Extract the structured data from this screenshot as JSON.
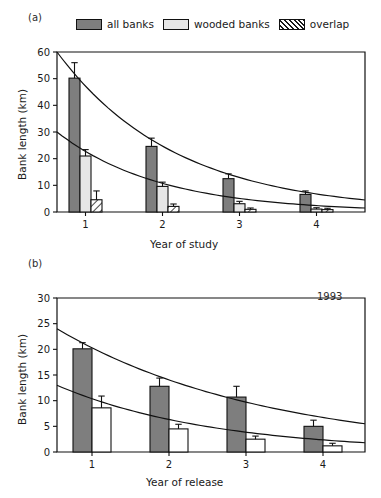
{
  "figure": {
    "panel_a_tag": "(a)",
    "panel_b_tag": "(b)"
  },
  "legend": {
    "items": [
      {
        "label": "all banks",
        "swatch": "dark-gray-fill",
        "color": "#7e7e7e"
      },
      {
        "label": "wooded banks",
        "swatch": "light-gray-fill",
        "color": "#e6e6e6"
      },
      {
        "label": "overlap",
        "swatch": "diagonal-hatch-fill",
        "color": "#ffffff"
      }
    ]
  },
  "chart_data": [
    {
      "type": "bar",
      "panel": "(a)",
      "title": "",
      "xlabel": "Year of study",
      "ylabel": "Bank length (km)",
      "categories": [
        "1",
        "2",
        "3",
        "4"
      ],
      "ylim": [
        0,
        60
      ],
      "yticks": [
        0,
        10,
        20,
        30,
        40,
        50,
        60
      ],
      "grid": false,
      "legend_position": "above-plot",
      "series": [
        {
          "name": "all banks",
          "color": "#7e7e7e",
          "values": [
            50.2,
            24.6,
            12.5,
            6.6
          ],
          "errors": [
            5.8,
            3.1,
            1.8,
            1.3
          ]
        },
        {
          "name": "wooded banks",
          "color": "#e6e6e6",
          "values": [
            21.0,
            9.6,
            3.1,
            1.1
          ],
          "errors": [
            2.4,
            1.6,
            0.9,
            0.5
          ]
        },
        {
          "name": "overlap",
          "color": "#ffffff",
          "values": [
            4.6,
            2.1,
            1.0,
            0.9
          ],
          "errors": [
            3.3,
            0.9,
            0.5,
            0.5
          ]
        }
      ],
      "curves": [
        {
          "name": "all banks fit",
          "start": 60.0,
          "end": 4.5
        },
        {
          "name": "wooded banks fit",
          "start": 30.0,
          "end": 1.5
        }
      ]
    },
    {
      "type": "bar",
      "panel": "(b)",
      "title": "",
      "annotation": "1993",
      "xlabel": "Year of release",
      "ylabel": "Bank length (km)",
      "categories": [
        "1",
        "2",
        "3",
        "4"
      ],
      "ylim": [
        0,
        30
      ],
      "yticks": [
        0,
        5,
        10,
        15,
        20,
        25,
        30
      ],
      "grid": false,
      "series": [
        {
          "name": "all banks",
          "color": "#7e7e7e",
          "values": [
            20.1,
            12.8,
            10.7,
            5.0
          ],
          "errors": [
            1.2,
            1.6,
            2.1,
            1.2
          ]
        },
        {
          "name": "wooded banks",
          "color": "#ffffff",
          "values": [
            8.6,
            4.5,
            2.5,
            1.2
          ],
          "errors": [
            2.3,
            0.9,
            0.6,
            0.5
          ]
        }
      ],
      "curves": [
        {
          "name": "all banks fit",
          "start": 24.0,
          "end": 5.5
        },
        {
          "name": "wooded banks fit",
          "start": 13.0,
          "end": 1.8
        }
      ]
    }
  ]
}
